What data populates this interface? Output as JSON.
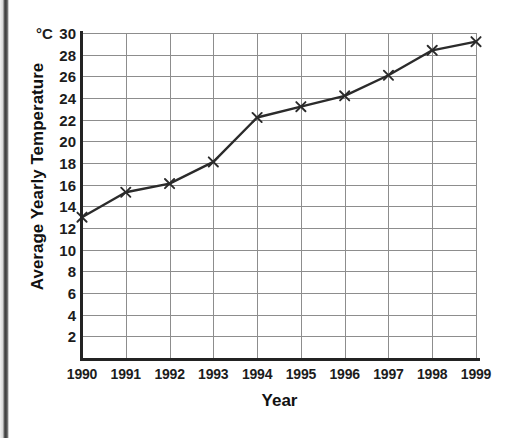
{
  "chart_data": {
    "type": "line",
    "title": "",
    "xlabel": "Year",
    "ylabel": "Average Yearly Temperature",
    "yunit": "°C",
    "categories": [
      "1990",
      "1991",
      "1992",
      "1993",
      "1994",
      "1995",
      "1996",
      "1997",
      "1998",
      "1999"
    ],
    "x": [
      1990,
      1991,
      1992,
      1993,
      1994,
      1995,
      1996,
      1997,
      1998,
      1999
    ],
    "values": [
      13.0,
      15.3,
      16.1,
      18.1,
      22.2,
      23.2,
      24.2,
      26.1,
      28.4,
      29.2
    ],
    "series": [
      {
        "name": "Average Yearly Temperature",
        "values": [
          13.0,
          15.3,
          16.1,
          18.1,
          22.2,
          23.2,
          24.2,
          26.1,
          28.4,
          29.2
        ]
      }
    ],
    "ylim": [
      0,
      30
    ],
    "xlim": [
      1990,
      1999
    ],
    "yticks": [
      30,
      28,
      26,
      24,
      22,
      20,
      18,
      16,
      14,
      12,
      10,
      8,
      6,
      4,
      2
    ],
    "xticks": [
      "1990",
      "1991",
      "1992",
      "1993",
      "1994",
      "1995",
      "1996",
      "1997",
      "1998",
      "1999"
    ],
    "grid": true,
    "legend": false,
    "legend_position": "none",
    "marker": "x",
    "line_color": "#2b2b2b",
    "grid_color": "#8d8d8d",
    "axis_color": "#232323",
    "background_color": "#ffffff"
  }
}
